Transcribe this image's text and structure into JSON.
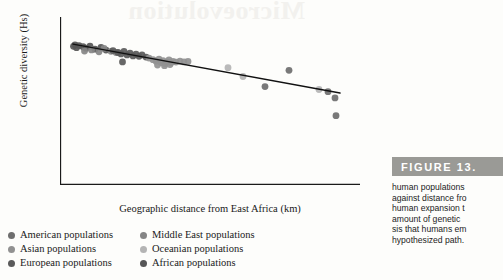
{
  "watermark_text": "Microevolution",
  "figure": {
    "number_label": "FIGURE  13.",
    "caption_lines": [
      "human populations",
      "against distance fro",
      "human expansion t",
      "amount of genetic",
      "sis that humans em",
      "hypothesized path."
    ]
  },
  "legend": {
    "items": [
      {
        "label": "American populations",
        "color": "#6e6e6e",
        "column": "left"
      },
      {
        "label": "Asian populations",
        "color": "#919191",
        "column": "left"
      },
      {
        "label": "European populations",
        "color": "#5a5a5a",
        "column": "left"
      },
      {
        "label": "Middle East populations",
        "color": "#858585",
        "column": "right"
      },
      {
        "label": "Oceanian populations",
        "color": "#b4b4b4",
        "column": "right"
      },
      {
        "label": "African populations",
        "color": "#565656",
        "column": "right"
      }
    ]
  },
  "chart_data": {
    "type": "scatter",
    "title": "",
    "xlabel": "Geographic distance from East Africa (km)",
    "ylabel": "Genetic diversity (Hs)",
    "xlim": [
      0,
      30000
    ],
    "ylim": [
      0.2,
      0.9
    ],
    "xticks": [
      0,
      5000,
      10000,
      15000,
      20000,
      25000,
      30000
    ],
    "xticklabels": [
      "0",
      "5,000",
      "10,000",
      "15,000",
      "20,000",
      "25,000",
      "30,000"
    ],
    "yticks": [
      0.2,
      0.3,
      0.4,
      0.5,
      0.6,
      0.7,
      0.8,
      0.9
    ],
    "yticklabels": [
      "0.2",
      "0.3",
      "0.4",
      "0.5",
      "0.6",
      "0.7",
      "0.8",
      "0.9"
    ],
    "grid": false,
    "legend_position": "below-axes",
    "marker_radius_px": 3.4,
    "trendline": {
      "label": "linear regression",
      "color": "#111111",
      "width_px": 1.5,
      "x": [
        1300,
        28000
      ],
      "y": [
        0.787,
        0.583
      ]
    },
    "series": [
      {
        "name": "African populations",
        "color": "#565656",
        "points": [
          [
            1350,
            0.778
          ],
          [
            1500,
            0.784
          ],
          [
            1650,
            0.772
          ],
          [
            1900,
            0.781
          ],
          [
            2300,
            0.776
          ],
          [
            2600,
            0.77
          ],
          [
            3000,
            0.779
          ],
          [
            3500,
            0.766
          ],
          [
            4100,
            0.773
          ],
          [
            4600,
            0.762
          ]
        ]
      },
      {
        "name": "Middle East populations",
        "color": "#858585",
        "points": [
          [
            2450,
            0.758
          ],
          [
            3150,
            0.763
          ],
          [
            3900,
            0.755
          ],
          [
            4400,
            0.769
          ],
          [
            5100,
            0.757
          ],
          [
            5600,
            0.752
          ]
        ]
      },
      {
        "name": "European populations",
        "color": "#5a5a5a",
        "points": [
          [
            5300,
            0.76
          ],
          [
            5800,
            0.752
          ],
          [
            6100,
            0.746
          ],
          [
            6400,
            0.757
          ],
          [
            6700,
            0.742
          ],
          [
            7000,
            0.749
          ],
          [
            7300,
            0.738
          ],
          [
            7600,
            0.745
          ],
          [
            7900,
            0.736
          ],
          [
            8200,
            0.742
          ],
          [
            6250,
            0.713
          ],
          [
            8600,
            0.733
          ]
        ]
      },
      {
        "name": "Asian populations",
        "color": "#919191",
        "points": [
          [
            8900,
            0.729
          ],
          [
            9300,
            0.722
          ],
          [
            9600,
            0.716
          ],
          [
            9900,
            0.724
          ],
          [
            10100,
            0.71
          ],
          [
            10300,
            0.718
          ],
          [
            10500,
            0.706
          ],
          [
            10700,
            0.713
          ],
          [
            10900,
            0.721
          ],
          [
            11100,
            0.709
          ],
          [
            11300,
            0.715
          ],
          [
            11600,
            0.712
          ],
          [
            12000,
            0.716
          ],
          [
            12400,
            0.713
          ],
          [
            12800,
            0.715
          ],
          [
            9750,
            0.7
          ],
          [
            10450,
            0.697
          ],
          [
            11000,
            0.702
          ]
        ]
      },
      {
        "name": "Oceanian populations",
        "color": "#b4b4b4",
        "points": [
          [
            16800,
            0.689
          ],
          [
            18300,
            0.652
          ],
          [
            25900,
            0.598
          ]
        ]
      },
      {
        "name": "American populations",
        "color": "#6e6e6e",
        "points": [
          [
            20500,
            0.61
          ],
          [
            22900,
            0.678
          ],
          [
            26800,
            0.589
          ],
          [
            27500,
            0.563
          ],
          [
            27600,
            0.489
          ]
        ]
      }
    ]
  }
}
